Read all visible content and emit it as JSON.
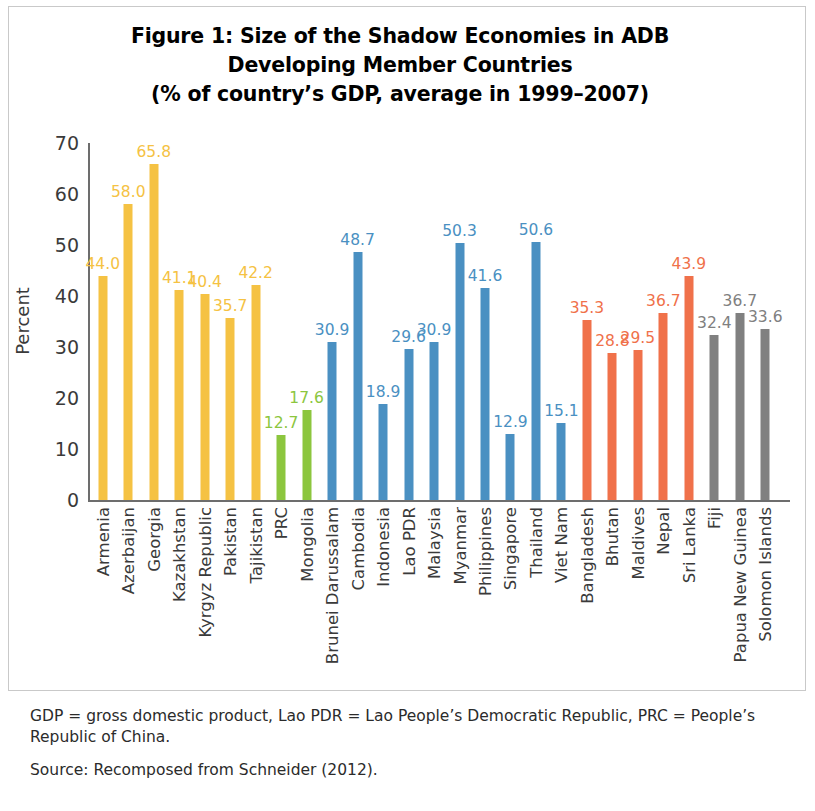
{
  "figure": {
    "title_lines": [
      "Figure 1: Size of the Shadow Economies in ADB",
      "Developing Member Countries",
      "(% of country’s GDP, average in 1999–2007)"
    ],
    "notes_definitions": "GDP = gross domestic product, Lao PDR = Lao People’s Democratic Republic, PRC = People’s Republic of China.",
    "notes_source": "Source: Recomposed from Schneider (2012)."
  },
  "palette": {
    "central_west_asia": "#F5C243",
    "east_asia": "#8CC63E",
    "southeast_asia": "#4A90C2",
    "south_asia": "#F0714A",
    "pacific": "#808080",
    "axis": "#6D6D6D",
    "text": "#3A3A3A",
    "frame": "#C9C9C9"
  },
  "chart_data": {
    "type": "bar",
    "title": "Figure 1: Size of the Shadow Economies in ADB Developing Member Countries (% of country’s GDP, average in 1999–2007)",
    "xlabel": "",
    "ylabel": "Percent",
    "ylim": [
      0,
      70
    ],
    "yticks": [
      0,
      10,
      20,
      30,
      40,
      50,
      60,
      70
    ],
    "grid": false,
    "legend": "none",
    "value_labels": true,
    "categories": [
      "Armenia",
      "Azerbaijan",
      "Georgia",
      "Kazakhstan",
      "Kyrgyz Republic",
      "Pakistan",
      "Tajikistan",
      "PRC",
      "Mongolia",
      "Brunei Darussalam",
      "Cambodia",
      "Indonesia",
      "Lao PDR",
      "Malaysia",
      "Myanmar",
      "Philippines",
      "Singapore",
      "Thailand",
      "Viet Nam",
      "Bangladesh",
      "Bhutan",
      "Maldives",
      "Nepal",
      "Sri Lanka",
      "Fiji",
      "Papua New Guinea",
      "Solomon Islands"
    ],
    "values": [
      44.0,
      58.0,
      65.8,
      41.1,
      40.4,
      35.7,
      42.2,
      12.7,
      17.6,
      30.9,
      48.7,
      18.9,
      29.6,
      30.9,
      50.3,
      41.6,
      12.9,
      50.6,
      15.1,
      35.3,
      28.8,
      29.5,
      36.7,
      43.9,
      32.4,
      36.7,
      33.6
    ],
    "value_label_texts": [
      "44.0",
      "58.0",
      "65.8",
      "41.1",
      "40.4",
      "35.7",
      "42.2",
      "12.7",
      "17.6",
      "30.9",
      "48.7",
      "18.9",
      "29.6",
      "30.9",
      "50.3",
      "41.6",
      "12.9",
      "50.6",
      "15.1",
      "35.3",
      "28.8",
      "29.5",
      "36.7",
      "43.9",
      "32.4",
      "36.7",
      "33.6"
    ],
    "bar_colors": [
      "#F5C243",
      "#F5C243",
      "#F5C243",
      "#F5C243",
      "#F5C243",
      "#F5C243",
      "#F5C243",
      "#8CC63E",
      "#8CC63E",
      "#4A90C2",
      "#4A90C2",
      "#4A90C2",
      "#4A90C2",
      "#4A90C2",
      "#4A90C2",
      "#4A90C2",
      "#4A90C2",
      "#4A90C2",
      "#4A90C2",
      "#F0714A",
      "#F0714A",
      "#F0714A",
      "#F0714A",
      "#F0714A",
      "#808080",
      "#808080",
      "#808080"
    ],
    "label_offsets_px": [
      0,
      0,
      0,
      0,
      0,
      0,
      0,
      0,
      0,
      0,
      0,
      0,
      0,
      0,
      0,
      0,
      0,
      0,
      0,
      0,
      0,
      0,
      0,
      0,
      0,
      0,
      0
    ]
  }
}
